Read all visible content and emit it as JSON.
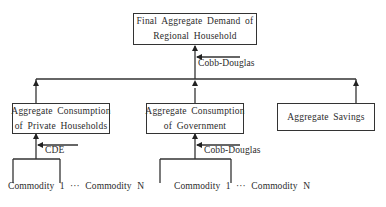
{
  "diagram": {
    "root": {
      "line1": "Final Aggregate Demand of",
      "line2": "Regional Household",
      "function_label": "Cobb-Douglas"
    },
    "children": [
      {
        "line1": "Aggregate Consumption",
        "line2": "of Private Households",
        "function_label": "CDE",
        "leaves": "Commodity 1 ··· Commodity N"
      },
      {
        "line1": "Aggregate Consumption",
        "line2": "of Government",
        "function_label": "Cobb-Douglas",
        "leaves": "Commodity 1 ··· Commodity N"
      },
      {
        "line1": "Aggregate Savings"
      }
    ],
    "colors": {
      "line": "#333333",
      "text": "#2b2b2b",
      "background": "#ffffff"
    }
  }
}
